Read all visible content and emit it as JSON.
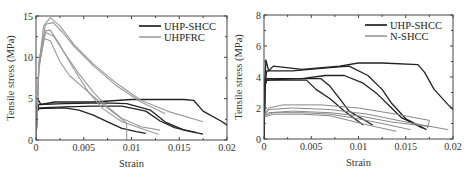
{
  "chart_data": [
    {
      "type": "line",
      "title": "",
      "xlabel": "Strain",
      "ylabel": "Tensile stress (MPa)",
      "xlim": [
        0,
        0.02
      ],
      "ylim": [
        0,
        15
      ],
      "xticks": [
        "0",
        "0.005",
        "0.01",
        "0.015",
        "0.02"
      ],
      "yticks": [
        "0",
        "5",
        "10",
        "15"
      ],
      "grid": false,
      "legend_position": "upper right",
      "legend": [
        "UHP-SHCC",
        "UHPFRC"
      ],
      "frame": {
        "left": 36,
        "top": 16,
        "right": 227,
        "bottom": 140
      },
      "series": [
        {
          "name": "UHP-SHCC",
          "color": "#222222",
          "width": 1.3,
          "points": [
            [
              0,
              0
            ],
            [
              0.0001,
              3.5
            ],
            [
              0.0002,
              5.0
            ],
            [
              0.0005,
              4.3
            ],
            [
              0.002,
              4.6
            ],
            [
              0.006,
              4.6
            ],
            [
              0.01,
              4.9
            ],
            [
              0.0125,
              4.9
            ],
            [
              0.0155,
              4.9
            ],
            [
              0.0165,
              4.8
            ],
            [
              0.0175,
              3.5
            ],
            [
              0.0195,
              2.2
            ],
            [
              0.02,
              1.8
            ]
          ]
        },
        {
          "name": "UHP-SHCC",
          "color": "#222222",
          "width": 1.3,
          "points": [
            [
              0,
              0
            ],
            [
              0.0001,
              3.6
            ],
            [
              0.0003,
              4.3
            ],
            [
              0.003,
              4.4
            ],
            [
              0.007,
              4.5
            ],
            [
              0.0095,
              4.4
            ],
            [
              0.012,
              3.6
            ],
            [
              0.0135,
              2.2
            ],
            [
              0.0155,
              1.2
            ],
            [
              0.0175,
              0.7
            ]
          ]
        },
        {
          "name": "UHP-SHCC",
          "color": "#222222",
          "width": 1.3,
          "points": [
            [
              0,
              0
            ],
            [
              0.0001,
              3.4
            ],
            [
              0.0003,
              3.9
            ],
            [
              0.003,
              4.0
            ],
            [
              0.006,
              4.1
            ],
            [
              0.009,
              4.1
            ],
            [
              0.0115,
              3.5
            ],
            [
              0.013,
              2.3
            ],
            [
              0.0145,
              1.5
            ],
            [
              0.0168,
              0.9
            ]
          ]
        },
        {
          "name": "UHP-SHCC",
          "color": "#222222",
          "width": 1.3,
          "points": [
            [
              0,
              0
            ],
            [
              0.0001,
              3.5
            ],
            [
              0.0003,
              3.8
            ],
            [
              0.003,
              3.9
            ],
            [
              0.0045,
              3.6
            ],
            [
              0.006,
              3.0
            ],
            [
              0.0075,
              2.2
            ],
            [
              0.009,
              1.4
            ],
            [
              0.0105,
              1.0
            ],
            [
              0.0115,
              0.8
            ]
          ]
        },
        {
          "name": "UHPFRC",
          "color": "#999999",
          "width": 1.1,
          "points": [
            [
              0,
              0
            ],
            [
              0.0003,
              9.0
            ],
            [
              0.0008,
              13.8
            ],
            [
              0.0015,
              14.8
            ],
            [
              0.0025,
              13.8
            ],
            [
              0.004,
              11.5
            ],
            [
              0.006,
              9.2
            ],
            [
              0.0085,
              6.8
            ],
            [
              0.011,
              4.8
            ],
            [
              0.014,
              3.4
            ],
            [
              0.0175,
              2.2
            ]
          ]
        },
        {
          "name": "UHPFRC",
          "color": "#999999",
          "width": 1.1,
          "points": [
            [
              0,
              0
            ],
            [
              0.0003,
              9.5
            ],
            [
              0.001,
              14.0
            ],
            [
              0.0018,
              14.2
            ],
            [
              0.0028,
              13.0
            ],
            [
              0.004,
              11.3
            ],
            [
              0.006,
              9.0
            ],
            [
              0.0085,
              6.5
            ],
            [
              0.011,
              4.6
            ],
            [
              0.0135,
              3.2
            ]
          ]
        },
        {
          "name": "UHPFRC",
          "color": "#999999",
          "width": 1.1,
          "points": [
            [
              0,
              0
            ],
            [
              0.0003,
              8.8
            ],
            [
              0.001,
              13.2
            ],
            [
              0.0015,
              13.3
            ],
            [
              0.0025,
              11.5
            ],
            [
              0.004,
              8.5
            ],
            [
              0.0055,
              5.8
            ],
            [
              0.007,
              3.8
            ],
            [
              0.009,
              2.2
            ],
            [
              0.0115,
              1.2
            ],
            [
              0.0128,
              0.7
            ]
          ]
        },
        {
          "name": "UHPFRC",
          "color": "#999999",
          "width": 1.1,
          "points": [
            [
              0,
              0
            ],
            [
              0.0003,
              9.0
            ],
            [
              0.001,
              13.0
            ],
            [
              0.0018,
              12.6
            ],
            [
              0.003,
              10.5
            ],
            [
              0.0045,
              8.0
            ],
            [
              0.006,
              5.8
            ],
            [
              0.0075,
              4.0
            ],
            [
              0.009,
              2.6
            ],
            [
              0.011,
              1.6
            ],
            [
              0.013,
              1.2
            ]
          ]
        },
        {
          "name": "UHPFRC",
          "color": "#999999",
          "width": 1.1,
          "points": [
            [
              0,
              0
            ],
            [
              0.0003,
              8.5
            ],
            [
              0.0008,
              12.3
            ],
            [
              0.0015,
              12.0
            ],
            [
              0.0025,
              9.5
            ],
            [
              0.0035,
              7.8
            ],
            [
              0.0055,
              5.8
            ],
            [
              0.007,
              4.3
            ],
            [
              0.0085,
              3.0
            ],
            [
              0.0095,
              2.0
            ],
            [
              0.0095,
              0
            ]
          ]
        }
      ]
    },
    {
      "type": "line",
      "title": "",
      "xlabel": "Strain",
      "ylabel": "Tensile stress (MPa)",
      "xlim": [
        0,
        0.02
      ],
      "ylim": [
        0,
        8
      ],
      "xticks": [
        "0",
        "0.005",
        "0.01",
        "0.015",
        "0.02"
      ],
      "yticks": [
        "0",
        "2",
        "4",
        "6",
        "8"
      ],
      "grid": false,
      "legend_position": "upper right",
      "legend": [
        "UHP-SHCC",
        "N-SHCC"
      ],
      "frame": {
        "left": 264,
        "top": 15,
        "right": 453,
        "bottom": 139
      },
      "series": [
        {
          "name": "UHP-SHCC",
          "color": "#222222",
          "width": 1.3,
          "points": [
            [
              0,
              0
            ],
            [
              0.0001,
              3.8
            ],
            [
              0.0002,
              5.1
            ],
            [
              0.0005,
              4.4
            ],
            [
              0.001,
              4.7
            ],
            [
              0.004,
              4.5
            ],
            [
              0.008,
              4.7
            ],
            [
              0.01,
              4.9
            ],
            [
              0.0125,
              4.9
            ],
            [
              0.0163,
              4.8
            ],
            [
              0.017,
              4.3
            ],
            [
              0.018,
              3.2
            ],
            [
              0.0195,
              2.2
            ],
            [
              0.02,
              1.9
            ]
          ]
        },
        {
          "name": "UHP-SHCC",
          "color": "#222222",
          "width": 1.3,
          "points": [
            [
              0,
              0
            ],
            [
              0.0001,
              3.6
            ],
            [
              0.0003,
              4.4
            ],
            [
              0.003,
              4.4
            ],
            [
              0.007,
              4.6
            ],
            [
              0.009,
              4.7
            ],
            [
              0.011,
              4.1
            ],
            [
              0.0125,
              3.2
            ],
            [
              0.0135,
              2.3
            ],
            [
              0.015,
              1.3
            ],
            [
              0.0172,
              0.6
            ]
          ]
        },
        {
          "name": "UHP-SHCC",
          "color": "#222222",
          "width": 1.3,
          "points": [
            [
              0,
              0
            ],
            [
              0.0001,
              3.4
            ],
            [
              0.0003,
              3.9
            ],
            [
              0.004,
              3.9
            ],
            [
              0.0065,
              4.1
            ],
            [
              0.0085,
              4.1
            ],
            [
              0.0105,
              3.6
            ],
            [
              0.012,
              2.9
            ],
            [
              0.0135,
              2.0
            ],
            [
              0.0145,
              1.4
            ],
            [
              0.0168,
              0.7
            ]
          ]
        },
        {
          "name": "UHP-SHCC",
          "color": "#222222",
          "width": 1.3,
          "points": [
            [
              0,
              0
            ],
            [
              0.0001,
              3.5
            ],
            [
              0.0003,
              3.8
            ],
            [
              0.0035,
              3.9
            ],
            [
              0.006,
              3.9
            ],
            [
              0.007,
              3.4
            ],
            [
              0.008,
              2.6
            ],
            [
              0.009,
              1.8
            ],
            [
              0.0115,
              0.9
            ]
          ]
        },
        {
          "name": "UHP-SHCC",
          "color": "#222222",
          "width": 1.3,
          "points": [
            [
              0,
              0
            ],
            [
              0.0001,
              3.5
            ],
            [
              0.0003,
              3.8
            ],
            [
              0.0045,
              3.8
            ],
            [
              0.0055,
              3.2
            ],
            [
              0.007,
              2.6
            ],
            [
              0.0085,
              1.8
            ],
            [
              0.0105,
              0.9
            ]
          ]
        },
        {
          "name": "N-SHCC",
          "color": "#888888",
          "width": 1.0,
          "points": [
            [
              0,
              1.6
            ],
            [
              0.0005,
              2.0
            ],
            [
              0.002,
              2.2
            ],
            [
              0.006,
              2.2
            ],
            [
              0.01,
              2.0
            ],
            [
              0.014,
              1.6
            ],
            [
              0.0175,
              1.2
            ],
            [
              0.0173,
              0.7
            ]
          ]
        },
        {
          "name": "N-SHCC",
          "color": "#888888",
          "width": 1.0,
          "points": [
            [
              0,
              1.5
            ],
            [
              0.0005,
              1.9
            ],
            [
              0.003,
              2.0
            ],
            [
              0.007,
              1.9
            ],
            [
              0.011,
              1.6
            ],
            [
              0.015,
              1.1
            ],
            [
              0.0195,
              0.6
            ]
          ]
        },
        {
          "name": "N-SHCC",
          "color": "#888888",
          "width": 1.0,
          "points": [
            [
              0,
              1.5
            ],
            [
              0.0005,
              1.7
            ],
            [
              0.003,
              1.8
            ],
            [
              0.007,
              1.7
            ],
            [
              0.01,
              1.5
            ],
            [
              0.0135,
              1.1
            ],
            [
              0.0175,
              0.8
            ]
          ]
        },
        {
          "name": "N-SHCC",
          "color": "#888888",
          "width": 1.0,
          "points": [
            [
              0,
              1.5
            ],
            [
              0.001,
              1.7
            ],
            [
              0.004,
              1.7
            ],
            [
              0.007,
              1.6
            ],
            [
              0.01,
              1.3
            ],
            [
              0.0125,
              1.0
            ],
            [
              0.0155,
              0.6
            ]
          ]
        },
        {
          "name": "N-SHCC",
          "color": "#888888",
          "width": 1.0,
          "points": [
            [
              0,
              1.4
            ],
            [
              0.001,
              1.6
            ],
            [
              0.004,
              1.6
            ],
            [
              0.007,
              1.5
            ],
            [
              0.009,
              1.2
            ],
            [
              0.011,
              0.9
            ],
            [
              0.014,
              0.5
            ]
          ]
        }
      ]
    }
  ]
}
